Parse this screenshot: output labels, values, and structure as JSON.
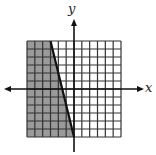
{
  "chart_data": {
    "type": "area",
    "title": "",
    "xlabel": "x",
    "ylabel": "y",
    "xlim": [
      -6,
      6
    ],
    "ylim": [
      -6,
      6
    ],
    "grid": true,
    "grid_step": 1,
    "boundary_line": {
      "equation": "y = -4x - 6",
      "style": "solid",
      "points": [
        [
          -3,
          6
        ],
        [
          0,
          -6
        ]
      ]
    },
    "shaded_region": {
      "inequality": "y <= -4x - 6",
      "side": "left of line",
      "color": "#9a9a9a"
    }
  },
  "labels": {
    "x_axis": "x",
    "y_axis": "y"
  },
  "colors": {
    "grid": "#333333",
    "shade": "#9a9a9a",
    "axis": "#111111",
    "background": "#ffffff"
  }
}
